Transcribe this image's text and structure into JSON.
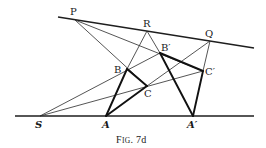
{
  "figure": {
    "caption": "Fig. 7d",
    "caption_parts": {
      "F": "F",
      "ig": "IG",
      "rest": ". 7d"
    },
    "colors": {
      "ink": "#1a1a1a",
      "background": "#ffffff"
    }
  },
  "points": {
    "P": {
      "label": "P",
      "x": 75,
      "y": 20
    },
    "R": {
      "label": "R",
      "x": 147,
      "y": 31
    },
    "Q": {
      "label": "Q",
      "x": 210,
      "y": 41
    },
    "B": {
      "label": "B",
      "x": 127,
      "y": 69
    },
    "B_prime": {
      "label": "B′",
      "x": 160,
      "y": 53
    },
    "C": {
      "label": "C",
      "x": 147,
      "y": 86
    },
    "C_prime": {
      "label": "C′",
      "x": 203,
      "y": 71
    },
    "S": {
      "label": "S",
      "x": 40,
      "y": 116
    },
    "A": {
      "label": "A",
      "x": 106,
      "y": 116
    },
    "A_prime": {
      "label": "A′",
      "x": 193,
      "y": 116
    }
  },
  "lines": [
    {
      "name": "line-PRQ",
      "from": [
        58,
        17
      ],
      "to": [
        254,
        48
      ],
      "weight": "med"
    },
    {
      "name": "line-base-SAA'",
      "from": [
        15,
        116
      ],
      "to": [
        254,
        116
      ],
      "weight": "med"
    },
    {
      "name": "line-P-B-C",
      "from": [
        75,
        20
      ],
      "to": [
        147,
        86
      ],
      "weight": "thin"
    },
    {
      "name": "line-P-B'-C'",
      "from": [
        75,
        20
      ],
      "to": [
        203,
        71
      ],
      "weight": "thin"
    },
    {
      "name": "line-S-B-B'",
      "from": [
        40,
        116
      ],
      "to": [
        160,
        53
      ],
      "weight": "thin"
    },
    {
      "name": "line-S-C-C'",
      "from": [
        40,
        116
      ],
      "to": [
        203,
        71
      ],
      "weight": "thin"
    },
    {
      "name": "line-R-B",
      "from": [
        147,
        31
      ],
      "to": [
        127,
        69
      ],
      "weight": "thin"
    },
    {
      "name": "line-R-B'",
      "from": [
        147,
        31
      ],
      "to": [
        160,
        53
      ],
      "weight": "thin"
    },
    {
      "name": "line-Q-C",
      "from": [
        210,
        41
      ],
      "to": [
        147,
        86
      ],
      "weight": "thin"
    },
    {
      "name": "line-Q-C'",
      "from": [
        210,
        41
      ],
      "to": [
        203,
        71
      ],
      "weight": "thin"
    }
  ],
  "triangles": {
    "ABC": [
      "A",
      "B",
      "C"
    ],
    "A'B'C'": [
      "A'",
      "B'",
      "C'"
    ]
  }
}
